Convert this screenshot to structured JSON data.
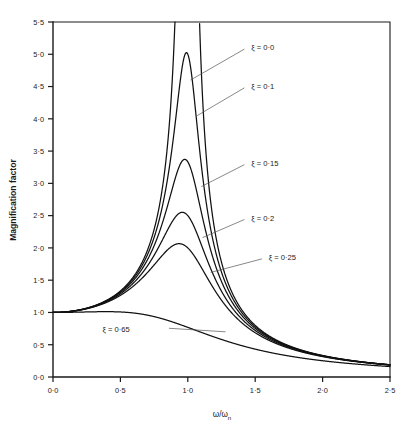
{
  "chart_data": {
    "type": "line",
    "title": "",
    "xlabel": "ω/ωₙ",
    "ylabel": "Magnification factor",
    "xlim": [
      0.0,
      2.5
    ],
    "ylim": [
      0.0,
      5.5
    ],
    "grid": false,
    "legend_position": "inline-annotations",
    "xticks": [
      "0·0",
      "0·5",
      "1·0",
      "1·5",
      "2·0",
      "2·5"
    ],
    "xtick_values": [
      0.0,
      0.5,
      1.0,
      1.5,
      2.0,
      2.5
    ],
    "yticks": [
      "0·0",
      "0·5",
      "1·0",
      "1·5",
      "2·0",
      "2·5",
      "3·0",
      "3·5",
      "4·0",
      "4·5",
      "5·0",
      "5·5"
    ],
    "ytick_values": [
      0.0,
      0.5,
      1.0,
      1.5,
      2.0,
      2.5,
      3.0,
      3.5,
      4.0,
      4.5,
      5.0,
      5.5
    ],
    "formula": "M = 1/sqrt((1-r^2)^2 + (2*zeta*r)^2)",
    "series": [
      {
        "name": "ξ = 0·0",
        "zeta": 0.0,
        "label": "ξ = 0·0",
        "peak_value": null,
        "peak_x": 1.0,
        "label_x": 1.47,
        "label_y": 5.11,
        "leader_from_x": 1.42,
        "leader_from_y": 5.08,
        "leader_to_x": 1.02,
        "leader_to_y": 4.6,
        "values_at": {
          "0.0": 1.0,
          "2.5": 0.19
        }
      },
      {
        "name": "ξ = 0·1",
        "zeta": 0.1,
        "label": "ξ = 0·1",
        "peak_value": 5.0,
        "peak_x": 0.99,
        "label_x": 1.47,
        "label_y": 4.51,
        "leader_from_x": 1.42,
        "leader_from_y": 4.48,
        "leader_to_x": 1.07,
        "leader_to_y": 4.05,
        "values_at": {
          "0.0": 1.0,
          "2.5": 0.19
        }
      },
      {
        "name": "ξ = 0·15",
        "zeta": 0.15,
        "label": "ξ = 0·15",
        "peak_value": 3.3,
        "peak_x": 0.98,
        "label_x": 1.47,
        "label_y": 3.32,
        "leader_from_x": 1.42,
        "leader_from_y": 3.29,
        "leader_to_x": 1.1,
        "leader_to_y": 2.95,
        "values_at": {
          "0.0": 1.0,
          "2.5": 0.19
        }
      },
      {
        "name": "ξ = 0·2",
        "zeta": 0.2,
        "label": "ξ = 0·2",
        "peak_value": 2.5,
        "peak_x": 0.96,
        "label_x": 1.47,
        "label_y": 2.47,
        "leader_from_x": 1.42,
        "leader_from_y": 2.44,
        "leader_to_x": 1.11,
        "leader_to_y": 2.16,
        "values_at": {
          "0.0": 1.0,
          "2.5": 0.19
        }
      },
      {
        "name": "ξ = 0·25",
        "zeta": 0.25,
        "label": "ξ = 0·25",
        "peak_value": 2.05,
        "peak_x": 0.94,
        "label_x": 1.6,
        "label_y": 1.86,
        "leader_from_x": 1.55,
        "leader_from_y": 1.83,
        "leader_to_x": 1.17,
        "leader_to_y": 1.62,
        "values_at": {
          "0.0": 1.0,
          "2.5": 0.19
        }
      },
      {
        "name": "ξ = 0·65",
        "zeta": 0.65,
        "label": "ξ = 0·65",
        "peak_value": null,
        "peak_x": null,
        "label_x": 0.57,
        "label_y": 0.74,
        "leader_from_x": 0.86,
        "leader_from_y": 0.755,
        "leader_to_x": 1.28,
        "leader_to_y": 0.7,
        "values_at": {
          "0.0": 1.0,
          "2.5": 0.19
        }
      }
    ]
  },
  "axes": {
    "y_title": "Magnification factor",
    "x_title_main": "ω/ω",
    "x_title_sub": "n"
  }
}
